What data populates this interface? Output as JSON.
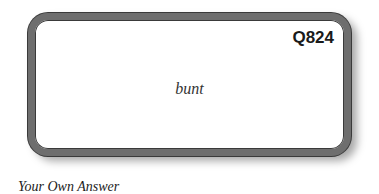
{
  "card": {
    "question_id": "Q824",
    "term": "bunt"
  },
  "answer": {
    "label": "Your Own Answer"
  }
}
